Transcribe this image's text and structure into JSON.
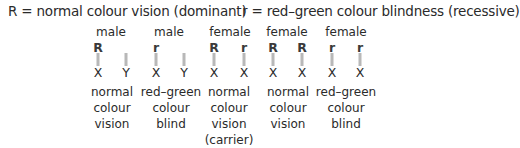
{
  "legend": {
    "dominant": "R  = normal colour vision (dominant)",
    "recessive": "r  = red–green colour blindness (recessive)"
  },
  "columns": [
    {
      "sex": "male",
      "chromosomes": [
        {
          "allele": "R",
          "label": "X"
        },
        {
          "allele": "",
          "label": "Y"
        }
      ],
      "description": [
        "normal",
        "colour",
        "vision"
      ]
    },
    {
      "sex": "male",
      "chromosomes": [
        {
          "allele": "r",
          "label": "X"
        },
        {
          "allele": "",
          "label": "Y"
        }
      ],
      "description": [
        "red–green",
        "colour",
        "blind"
      ]
    },
    {
      "sex": "female",
      "chromosomes": [
        {
          "allele": "R",
          "label": "X"
        },
        {
          "allele": "r",
          "label": "X"
        }
      ],
      "description": [
        "normal",
        "colour",
        "vision",
        "(carrier)"
      ]
    },
    {
      "sex": "female",
      "chromosomes": [
        {
          "allele": "R",
          "label": "X"
        },
        {
          "allele": "R",
          "label": "X"
        }
      ],
      "description": [
        "normal",
        "colour",
        "vision"
      ]
    },
    {
      "sex": "female",
      "chromosomes": [
        {
          "allele": "r",
          "label": "X"
        },
        {
          "allele": "r",
          "label": "X"
        }
      ],
      "description": [
        "red–green",
        "colour",
        "blind"
      ]
    }
  ]
}
